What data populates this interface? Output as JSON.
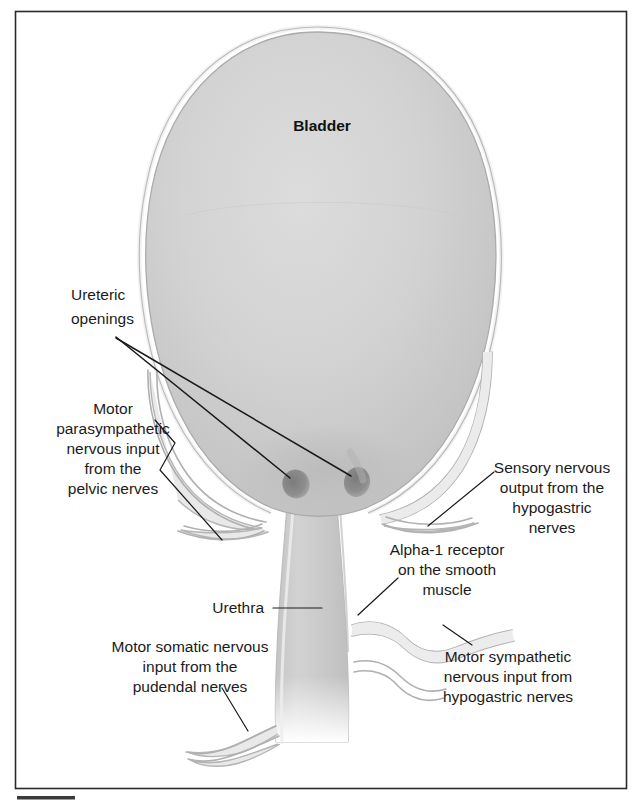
{
  "figure": {
    "kind": "anatomical-diagram",
    "background_color": "#ffffff",
    "frame_color": "#2a2a2a",
    "organ_fill_color": "#cfcfcf",
    "nerve_color": "#b0b0b0",
    "leader_color": "#1a1a1a",
    "ureteric_opening_color": "#8a8a8a"
  },
  "labels": {
    "bladder": "Bladder",
    "ureteric_openings": {
      "line1": "Ureteric",
      "line2": "openings"
    },
    "motor_parasympathetic": {
      "line1": "Motor",
      "line2": "parasympathetic",
      "line3": "nervous input",
      "line4": "from the",
      "line5": "pelvic nerves"
    },
    "sensory_hypogastric": {
      "line1": "Sensory nervous",
      "line2": "output from the",
      "line3": "hypogastric",
      "line4": "nerves"
    },
    "alpha1_receptor": {
      "line1": "Alpha-1 receptor",
      "line2": "on the smooth",
      "line3": "muscle"
    },
    "urethra": "Urethra",
    "motor_somatic": {
      "line1": "Motor somatic nervous",
      "line2": "input from the",
      "line3": "pudendal nerves"
    },
    "motor_sympathetic": {
      "line1": "Motor sympathetic",
      "line2": "nervous input from",
      "line3": "hypogastric nerves"
    }
  },
  "structures": [
    {
      "name": "bladder-body",
      "description": "Large ovoid bladder dome"
    },
    {
      "name": "ureteric-opening-left",
      "description": "Dark oval opening on trigone"
    },
    {
      "name": "ureteric-opening-right",
      "description": "Dark oval opening on trigone"
    },
    {
      "name": "urethra-tube",
      "description": "Vertical tube below bladder neck"
    },
    {
      "name": "pelvic-nerve-bundle",
      "description": "Left nerve bundle to bladder"
    },
    {
      "name": "hypogastric-nerve-bundle-right",
      "description": "Right nerve bundle"
    },
    {
      "name": "pudendal-nerve-bundle",
      "description": "Lower-left nerve bundle"
    },
    {
      "name": "sympathetic-nerve-bundle",
      "description": "Lower-right nerve bundle"
    }
  ]
}
